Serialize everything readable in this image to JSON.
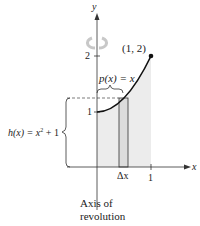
{
  "figure": {
    "y_axis_label": "y",
    "x_axis_label": "x",
    "y_tick_2": "2",
    "y_tick_1": "1",
    "x_tick_1": "1",
    "point_label": "(1, 2)",
    "radius_label": "p(x) = x",
    "height_label_prefix": "h(x) = x",
    "height_label_exp": "2",
    "height_label_suffix": " + 1",
    "delta_label": "Δx",
    "axis_caption_line1": "Axis of",
    "axis_caption_line2": "revolution",
    "colors": {
      "shade": "#ececec",
      "rect_fill": "#dcdcdc",
      "stroke": "#222222",
      "rotation_arrow": "#c8c8c8"
    }
  }
}
